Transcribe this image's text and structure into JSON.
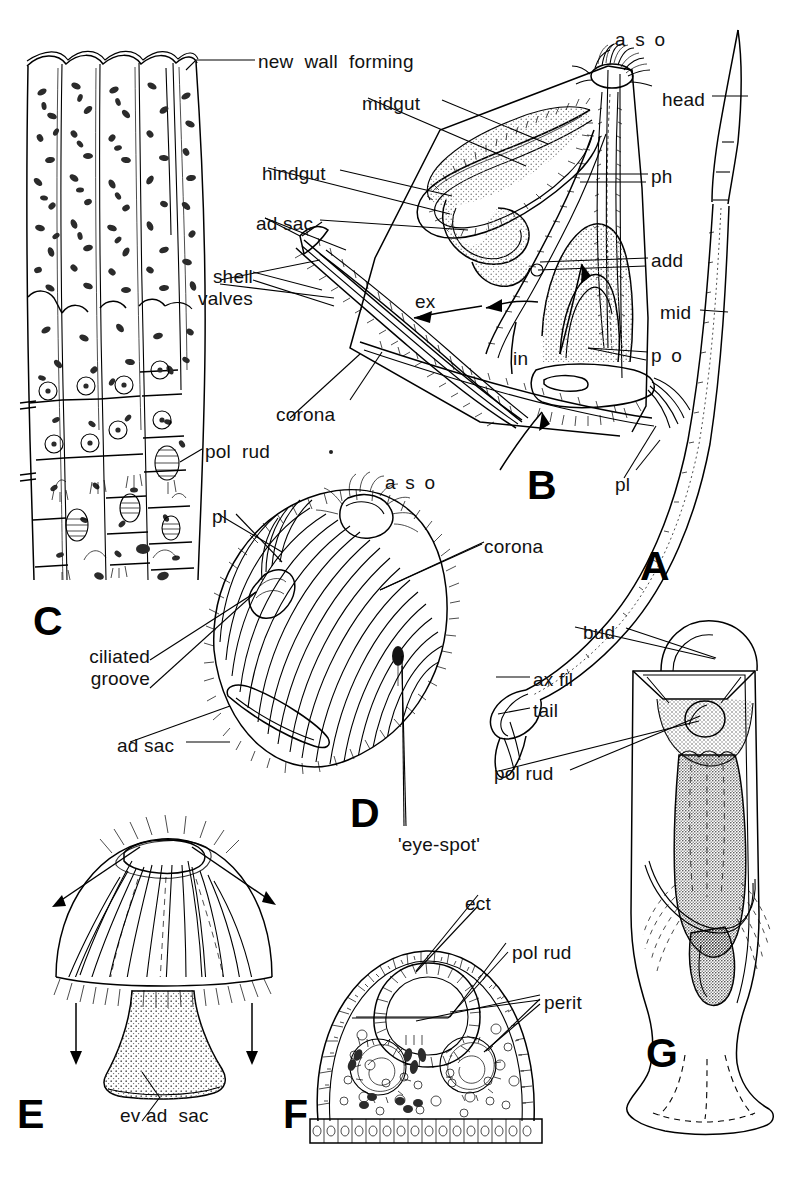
{
  "figure": {
    "width": 799,
    "height": 1177,
    "background": "#ffffff",
    "ink": "#000000",
    "type": "scientific-line-illustration",
    "panel_letters": [
      {
        "id": "A",
        "label": "A",
        "x": 640,
        "y": 546
      },
      {
        "id": "B",
        "label": "B",
        "x": 527,
        "y": 465
      },
      {
        "id": "C",
        "label": "C",
        "x": 33,
        "y": 601
      },
      {
        "id": "D",
        "label": "D",
        "x": 350,
        "y": 793
      },
      {
        "id": "E",
        "label": "E",
        "x": 17,
        "y": 1094
      },
      {
        "id": "F",
        "label": "F",
        "x": 283,
        "y": 1094
      },
      {
        "id": "G",
        "label": "G",
        "x": 646,
        "y": 1033
      }
    ],
    "labels": [
      {
        "id": "new-wall-forming",
        "text": "new  wall  forming",
        "x": 258,
        "y": 51,
        "panel": "C",
        "align": "left"
      },
      {
        "id": "midgut",
        "text": "midgut",
        "x": 362,
        "y": 93,
        "panel": "B",
        "align": "left"
      },
      {
        "id": "hindgut",
        "text": "hindgut",
        "x": 262,
        "y": 163,
        "panel": "B",
        "align": "left"
      },
      {
        "id": "ad-sac-b",
        "text": "ad sac",
        "x": 256,
        "y": 213,
        "panel": "B",
        "align": "left"
      },
      {
        "id": "shell-valves",
        "text": "shell\nvalves",
        "x": 203,
        "y": 266,
        "panel": "B",
        "align": "right"
      },
      {
        "id": "ex",
        "text": "ex",
        "x": 415,
        "y": 291,
        "panel": "B",
        "align": "left"
      },
      {
        "id": "in",
        "text": "in",
        "x": 513,
        "y": 348,
        "panel": "B",
        "align": "left"
      },
      {
        "id": "corona-b",
        "text": "corona",
        "x": 276,
        "y": 404,
        "panel": "B",
        "align": "left"
      },
      {
        "id": "aso-b",
        "text": "a s o",
        "x": 615,
        "y": 29,
        "panel": "B",
        "align": "left",
        "wide": true
      },
      {
        "id": "ph",
        "text": "ph",
        "x": 651,
        "y": 166,
        "panel": "B",
        "align": "left"
      },
      {
        "id": "add",
        "text": "add",
        "x": 651,
        "y": 250,
        "panel": "B",
        "align": "left"
      },
      {
        "id": "po",
        "text": "p o",
        "x": 651,
        "y": 345,
        "panel": "B",
        "align": "left",
        "wide": true
      },
      {
        "id": "pl-b",
        "text": "pl",
        "x": 615,
        "y": 474,
        "panel": "B",
        "align": "left"
      },
      {
        "id": "head",
        "text": "head",
        "x": 662,
        "y": 89,
        "panel": "A",
        "align": "left"
      },
      {
        "id": "mid",
        "text": "mid",
        "x": 660,
        "y": 302,
        "panel": "A",
        "align": "left"
      },
      {
        "id": "ax-fil",
        "text": "ax fil",
        "x": 533,
        "y": 669,
        "panel": "A",
        "align": "left"
      },
      {
        "id": "tail",
        "text": "tail",
        "x": 533,
        "y": 700,
        "panel": "A",
        "align": "left"
      },
      {
        "id": "pol-rud-c",
        "text": "pol  rud",
        "x": 205,
        "y": 441,
        "panel": "C",
        "align": "left"
      },
      {
        "id": "aso-d",
        "text": "a s o",
        "x": 385,
        "y": 472,
        "panel": "D",
        "align": "left",
        "wide": true
      },
      {
        "id": "pl-d",
        "text": "pl",
        "x": 212,
        "y": 506,
        "panel": "D",
        "align": "left"
      },
      {
        "id": "corona-d",
        "text": "corona",
        "x": 484,
        "y": 536,
        "panel": "D",
        "align": "left"
      },
      {
        "id": "ciliated-groove",
        "text": "ciliated\ngroove",
        "x": 138,
        "y": 646,
        "panel": "D",
        "align": "right"
      },
      {
        "id": "ad-sac-d",
        "text": "ad sac",
        "x": 117,
        "y": 735,
        "panel": "D",
        "align": "left"
      },
      {
        "id": "eye-spot",
        "text": "'eye-spot'",
        "x": 398,
        "y": 834,
        "panel": "D",
        "align": "left"
      },
      {
        "id": "bud",
        "text": "bud",
        "x": 583,
        "y": 622,
        "panel": "G",
        "align": "left"
      },
      {
        "id": "pol-rud-g",
        "text": "pol rud",
        "x": 494,
        "y": 763,
        "panel": "G",
        "align": "left"
      },
      {
        "id": "ev-ad-sac",
        "text": "ev ad  sac",
        "x": 120,
        "y": 1105,
        "panel": "E",
        "align": "left"
      },
      {
        "id": "ect",
        "text": "ect",
        "x": 465,
        "y": 893,
        "panel": "F",
        "align": "left"
      },
      {
        "id": "pol-rud-f",
        "text": "pol rud",
        "x": 512,
        "y": 942,
        "panel": "F",
        "align": "left"
      },
      {
        "id": "perit",
        "text": "perit",
        "x": 544,
        "y": 992,
        "panel": "F",
        "align": "left"
      }
    ],
    "abbreviation_glossary": {
      "aso": "apical sensory organ",
      "ph": "pharynx",
      "add": "adductor",
      "po": "posterior organ",
      "pl": "pseudo-lateral cilia",
      "mid": "middle region",
      "ax fil": "axial filament",
      "ect": "ectoderm",
      "perit": "peritoneum",
      "pol rud": "polar rudiment",
      "ad sac": "adhesive sac",
      "ev ad sac": "everted adhesive sac",
      "ex": "eversion",
      "in": "inversion"
    }
  }
}
